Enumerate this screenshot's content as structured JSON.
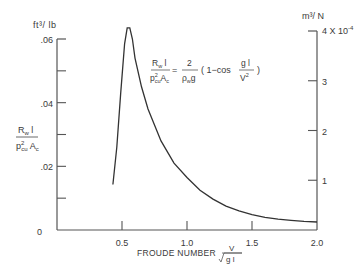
{
  "chart_data": {
    "type": "line",
    "title": "",
    "xlabel": "FROUDE NUMBER",
    "xlabel_formula": {
      "num": "V",
      "den": "√g l"
    },
    "ylabel_left": {
      "num": "R_w l",
      "den": "ρ²_cu A_c"
    },
    "ylabel_left_units": "ft³/lb",
    "ylabel_right_units": "m³/N",
    "xlim": [
      0,
      2.0
    ],
    "ylim_left": [
      0,
      0.06
    ],
    "ylim_right": [
      0,
      0.0004
    ],
    "x_ticks": [
      "0.5",
      "1.0",
      "1.5",
      "2.0"
    ],
    "y_ticks_left": [
      "0",
      ".02",
      ".04",
      ".06"
    ],
    "y_ticks_right": [
      "1",
      "2",
      "3",
      "4 X 10⁻⁴"
    ],
    "grid": false,
    "annotation": {
      "lhs_num": "R_w l",
      "lhs_den": "p²_cu A_c",
      "rhs_num": "2",
      "rhs_den": "ρ_w g",
      "rhs_bracket": "( 1 − cos  g l / V² )"
    },
    "series": [
      {
        "name": "R_w l / (ρ² A_c)",
        "x": [
          0.43,
          0.46,
          0.49,
          0.52,
          0.54,
          0.56,
          0.58,
          0.6,
          0.65,
          0.7,
          0.8,
          0.9,
          1.0,
          1.1,
          1.2,
          1.3,
          1.4,
          1.5,
          1.6,
          1.7,
          1.8,
          1.9,
          2.0
        ],
        "values": [
          0.0143,
          0.026,
          0.043,
          0.0585,
          0.0635,
          0.0635,
          0.06,
          0.054,
          0.045,
          0.038,
          0.028,
          0.021,
          0.0165,
          0.0125,
          0.0097,
          0.0075,
          0.006,
          0.0048,
          0.004,
          0.0034,
          0.003,
          0.0027,
          0.0025
        ]
      }
    ]
  },
  "texts": {
    "left_units": "ft³/ lb",
    "right_units": "m³/ N",
    "right_top_tick": "4 X 10",
    "right_top_exp": "-4",
    "xlabel": "FROUDE NUMBER",
    "xformula_num": "V",
    "xformula_den": "g l",
    "origin": "0"
  }
}
